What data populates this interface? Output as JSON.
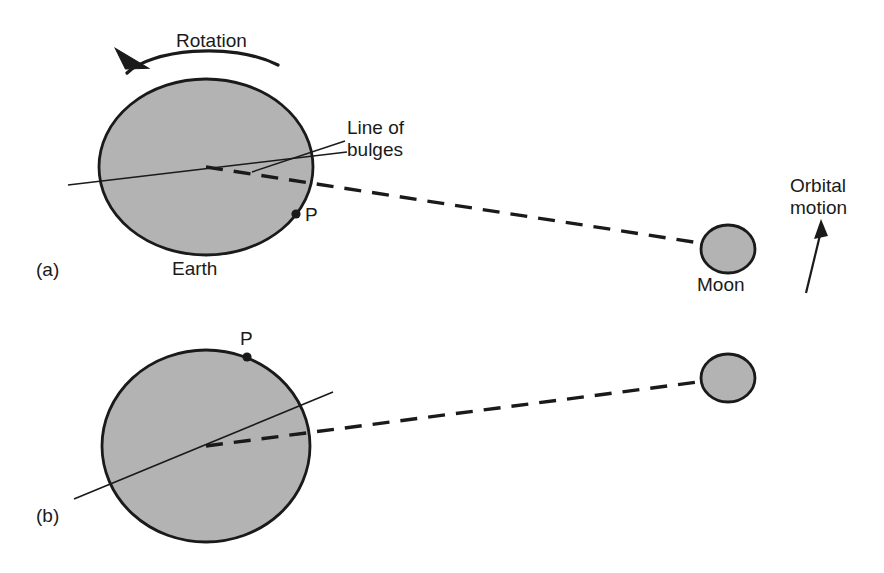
{
  "figure": {
    "background_color": "#ffffff",
    "body_fill": "#b3b3b3",
    "stroke_color": "#1a1a1a"
  },
  "labels": {
    "rotation": "Rotation",
    "line_of_bulges": "Line of\nbulges",
    "earth": "Earth",
    "moon": "Moon",
    "orbital_motion": "Orbital\nmotion",
    "point_p_a": "P",
    "point_p_b": "P",
    "panel_a": "(a)",
    "panel_b": "(b)"
  },
  "panels": [
    {
      "id": "a",
      "label": "(a)",
      "earth": {
        "cx": 206,
        "cy": 167,
        "rx": 107,
        "ry": 88,
        "fill": "#b3b3b3"
      },
      "moon": {
        "cx": 728,
        "cy": 249,
        "rx": 27,
        "ry": 24,
        "fill": "#b3b3b3"
      },
      "line_of_bulges": {
        "x1": 68,
        "y1": 185,
        "x2": 347,
        "y2": 152
      },
      "earth_moon_line": {
        "x1": 206,
        "y1": 167,
        "x2": 728,
        "y2": 249,
        "style": "dashed"
      },
      "point_p": {
        "x": 296,
        "y": 214
      },
      "rotation_arrow": "counterclockwise"
    },
    {
      "id": "b",
      "label": "(b)",
      "earth": {
        "cx": 206,
        "cy": 446,
        "rx": 104,
        "ry": 96,
        "fill": "#b3b3b3"
      },
      "moon": {
        "cx": 728,
        "cy": 378,
        "rx": 27,
        "ry": 24,
        "fill": "#b3b3b3"
      },
      "line_of_bulges": {
        "x1": 74,
        "y1": 499,
        "x2": 333,
        "y2": 392
      },
      "earth_moon_line": {
        "x1": 206,
        "y1": 446,
        "x2": 728,
        "y2": 378,
        "style": "dashed"
      },
      "point_p": {
        "x": 247,
        "y": 357
      }
    }
  ],
  "annotations": {
    "leader_line_bulges": {
      "x1": 252,
      "y1": 172,
      "x2": 347,
      "y2": 140
    },
    "orbital_arrow": {
      "x1": 808,
      "y1": 292,
      "x2": 821,
      "y2": 224,
      "direction": "up"
    }
  }
}
